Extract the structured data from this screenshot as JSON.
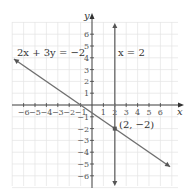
{
  "chart_data": {
    "type": "line",
    "title": "",
    "xlabel": "x",
    "ylabel": "y",
    "xlim": [
      -6.5,
      7
    ],
    "ylim": [
      -6.5,
      7
    ],
    "grid": true,
    "x_ticks": [
      -6,
      -5,
      -4,
      -3,
      -2,
      -1,
      1,
      2,
      3,
      4,
      5,
      6
    ],
    "y_ticks": [
      -6,
      -5,
      -4,
      -3,
      -2,
      -1,
      1,
      2,
      3,
      4,
      5,
      6
    ],
    "series": [
      {
        "name": "2x + 3y = −2",
        "type": "line",
        "points": [
          [
            -7,
            4
          ],
          [
            7,
            -5.33
          ]
        ],
        "color": "#777777"
      },
      {
        "name": "x = 2",
        "type": "vertical-line",
        "x": 2,
        "color": "#777777"
      }
    ],
    "annotations": [
      {
        "text": "2x + 3y = −2",
        "near": [
          -6.5,
          4.5
        ]
      },
      {
        "text": "x = 2",
        "near": [
          2.3,
          4.5
        ]
      },
      {
        "text": "(2, −2)",
        "point": [
          2,
          -2
        ]
      }
    ],
    "intersection_point": [
      2,
      -2
    ]
  },
  "labels": {
    "x_axis": "x",
    "y_axis": "y",
    "line1": "2x + 3y = −2",
    "line2": "x = 2",
    "point": "(2, −2)"
  }
}
